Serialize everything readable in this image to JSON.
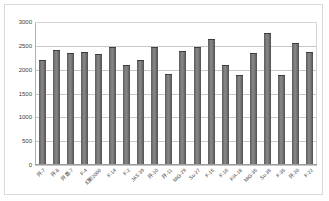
{
  "chart_data": {
    "type": "bar",
    "title": "",
    "subtitle": "",
    "xlabel": "",
    "ylabel": "",
    "ylim": [
      0,
      3000
    ],
    "ytick_values": [
      0,
      500,
      1000,
      1500,
      2000,
      2500,
      3000
    ],
    "ytick_labels": [
      "0",
      "500",
      "1000",
      "1500",
      "2000",
      "2500",
      "3000"
    ],
    "grid": true,
    "legend": false,
    "legend_position": "none",
    "bar_color": "#7a7a7a",
    "categories": [
      "歼-7",
      "歼-8",
      "歼轰-7",
      "F-4",
      "幻影2000",
      "F-14",
      "F-2",
      "JAS 39",
      "歼-10",
      "歼-11",
      "MiG-29",
      "Su-27",
      "F-15",
      "F-16",
      "F/A-18",
      "MiG-35",
      "Su-35",
      "F-35",
      "歼-20",
      "F-22"
    ],
    "values": [
      2210,
      2410,
      2350,
      2375,
      2330,
      2470,
      2105,
      2200,
      2470,
      1900,
      2390,
      2470,
      2640,
      2090,
      1880,
      2360,
      2760,
      1880,
      2565,
      2380
    ]
  },
  "plot": {
    "axis_color": "#b0b0b0",
    "gridline_color": "#c8c8c8",
    "border_color": "#d9d9d9",
    "background": "#ffffff"
  }
}
